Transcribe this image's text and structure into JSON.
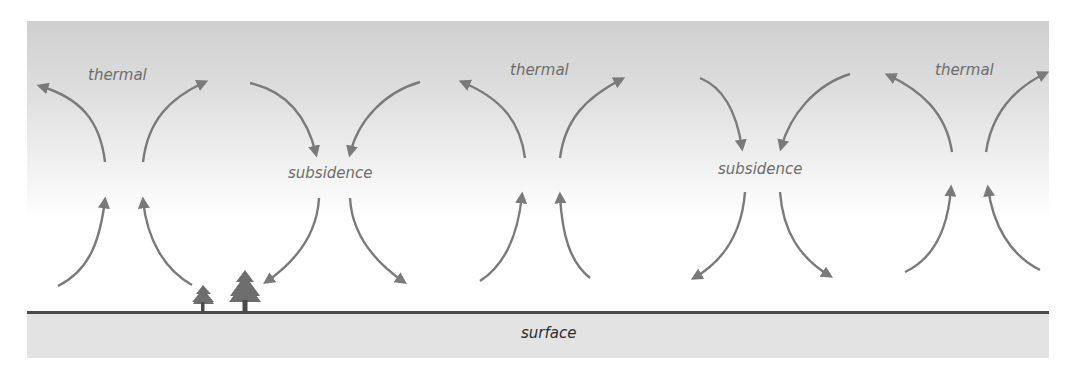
{
  "diagram": {
    "labels": {
      "thermal_1": "thermal",
      "thermal_2": "thermal",
      "thermal_3": "thermal",
      "subsidence_1": "subsidence",
      "subsidence_2": "subsidence",
      "surface": "surface"
    },
    "colors": {
      "arrow": "#7a7a7a",
      "label_text": "#6d6d6d",
      "surface_text": "#2e2e2e",
      "ground": "#e3e3e3",
      "ground_line": "#4a4a4a",
      "tree": "#6e6e6e",
      "sky_top": "#cfcfcf",
      "sky_bottom": "#ffffff"
    }
  }
}
